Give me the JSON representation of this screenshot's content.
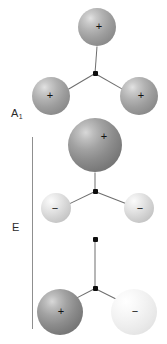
{
  "figure": {
    "background_color": "#ffffff",
    "width": 167,
    "height": 344
  },
  "labels": {
    "a1": {
      "text": "A",
      "subscript": "1",
      "x": 11,
      "y": 108
    },
    "e": {
      "text": "E",
      "x": 12,
      "y": 222
    }
  },
  "bracket": {
    "name": "e-mode-bracket",
    "x": 32,
    "y": 137,
    "height": 192,
    "color": "#8f8f8f"
  },
  "colors": {
    "bond": "#6e6e6e",
    "node": "#0d0d0d",
    "sign": "#111111",
    "label": "#2b2b2b",
    "sphere_dark": "#8c8c8c",
    "sphere_mid": "#9d9d9d",
    "sphere_light": "#d2d2d2",
    "sphere_palest": "#ebebeb"
  },
  "structures": [
    {
      "name": "mode-a1",
      "symmetry": "A1",
      "center": {
        "x": 95,
        "y": 73,
        "size": 5
      },
      "atoms": [
        {
          "name": "atom-top",
          "charge": "+",
          "shade": "mid",
          "cx": 97,
          "cy": 27,
          "r": 19,
          "sign_dx": 2,
          "sign_dy": -1,
          "sign_size": 11
        },
        {
          "name": "atom-lower-left",
          "charge": "+",
          "shade": "mid",
          "cx": 51,
          "cy": 96,
          "r": 19,
          "sign_dx": -1,
          "sign_dy": -1,
          "sign_size": 11
        },
        {
          "name": "atom-lower-right",
          "charge": "+",
          "shade": "mid",
          "cx": 139,
          "cy": 96,
          "r": 19,
          "sign_dx": 2,
          "sign_dy": -1,
          "sign_size": 11
        }
      ],
      "bonds": [
        {
          "name": "bond-center-top",
          "x1": 95,
          "y1": 73,
          "x2": 97,
          "y2": 46
        },
        {
          "name": "bond-center-lower-left",
          "x1": 95,
          "y1": 73,
          "x2": 68,
          "y2": 89
        },
        {
          "name": "bond-center-lower-right",
          "x1": 95,
          "y1": 73,
          "x2": 123,
          "y2": 89
        }
      ]
    },
    {
      "name": "mode-e-1",
      "symmetry": "E",
      "center": {
        "x": 95,
        "y": 191,
        "size": 5
      },
      "atoms": [
        {
          "name": "atom-top",
          "charge": "+",
          "shade": "dark",
          "cx": 95,
          "cy": 145,
          "r": 27,
          "sign_dx": 9,
          "sign_dy": -9,
          "sign_size": 11
        },
        {
          "name": "atom-lower-left",
          "charge": "−",
          "shade": "light",
          "cx": 56,
          "cy": 208,
          "r": 15,
          "sign_dx": -1,
          "sign_dy": 0,
          "sign_size": 11
        },
        {
          "name": "atom-lower-right",
          "charge": "−",
          "shade": "light",
          "cx": 139,
          "cy": 208,
          "r": 15,
          "sign_dx": 1,
          "sign_dy": 0,
          "sign_size": 11
        }
      ],
      "bonds": [
        {
          "name": "bond-center-top",
          "x1": 95,
          "y1": 191,
          "x2": 95,
          "y2": 172
        },
        {
          "name": "bond-center-lower-left",
          "x1": 95,
          "y1": 191,
          "x2": 70,
          "y2": 203
        },
        {
          "name": "bond-center-lower-right",
          "x1": 95,
          "y1": 191,
          "x2": 126,
          "y2": 203
        }
      ]
    },
    {
      "name": "mode-e-2",
      "symmetry": "E",
      "center": {
        "x": 95,
        "y": 288,
        "size": 5
      },
      "top_node": {
        "name": "node-top",
        "x": 95,
        "y": 239,
        "size": 5
      },
      "atoms": [
        {
          "name": "atom-lower-left",
          "charge": "+",
          "shade": "dark",
          "cx": 60,
          "cy": 312,
          "r": 23,
          "sign_dx": 1,
          "sign_dy": -1,
          "sign_size": 11
        },
        {
          "name": "atom-lower-right",
          "charge": "−",
          "shade": "palest",
          "cx": 134,
          "cy": 312,
          "r": 23,
          "sign_dx": 1,
          "sign_dy": -1,
          "sign_size": 11
        }
      ],
      "bonds": [
        {
          "name": "bond-center-topnode",
          "x1": 95,
          "y1": 288,
          "x2": 95,
          "y2": 239
        },
        {
          "name": "bond-center-lower-left",
          "x1": 95,
          "y1": 288,
          "x2": 70,
          "y2": 301
        },
        {
          "name": "bond-center-lower-right",
          "x1": 95,
          "y1": 288,
          "x2": 121,
          "y2": 301
        }
      ]
    }
  ]
}
